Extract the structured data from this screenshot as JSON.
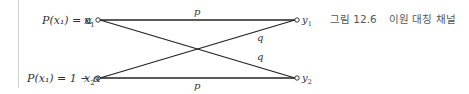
{
  "figure": {
    "caption_label": "그림 12.6",
    "caption_title": "이원 대칭 채널"
  },
  "inputs": [
    {
      "prob_label": "P(x₁) = α",
      "node_label": "x",
      "node_sub": "1"
    },
    {
      "prob_label": "P(x₁) = 1 − α",
      "node_label": "x",
      "node_sub": "2"
    }
  ],
  "outputs": [
    {
      "node_label": "y",
      "node_sub": "1"
    },
    {
      "node_label": "y",
      "node_sub": "2"
    }
  ],
  "edges": [
    {
      "from": "x1",
      "to": "y1",
      "label": "p"
    },
    {
      "from": "x1",
      "to": "y2",
      "label": "q"
    },
    {
      "from": "x2",
      "to": "y1",
      "label": "q"
    },
    {
      "from": "x2",
      "to": "y2",
      "label": "p"
    }
  ],
  "colors": {
    "line": "#222222",
    "text": "#333333",
    "caption": "#555555",
    "rule": "#cfcfcf"
  }
}
